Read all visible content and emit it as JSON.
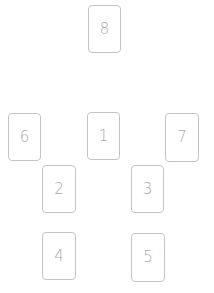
{
  "spread": {
    "cards": [
      {
        "label": "8",
        "x": 88,
        "y": 5,
        "w": 33,
        "h": 48
      },
      {
        "label": "6",
        "x": 8,
        "y": 113,
        "w": 33,
        "h": 48
      },
      {
        "label": "1",
        "x": 87,
        "y": 112,
        "w": 33,
        "h": 48
      },
      {
        "label": "7",
        "x": 165,
        "y": 113,
        "w": 34,
        "h": 49
      },
      {
        "label": "2",
        "x": 42,
        "y": 165,
        "w": 34,
        "h": 48
      },
      {
        "label": "3",
        "x": 131,
        "y": 165,
        "w": 33,
        "h": 48
      },
      {
        "label": "4",
        "x": 42,
        "y": 232,
        "w": 34,
        "h": 48
      },
      {
        "label": "5",
        "x": 131,
        "y": 233,
        "w": 34,
        "h": 49
      }
    ]
  },
  "colors": {
    "border": "#c4c4c4",
    "label": "#a8a8a8",
    "background": "#ffffff"
  }
}
